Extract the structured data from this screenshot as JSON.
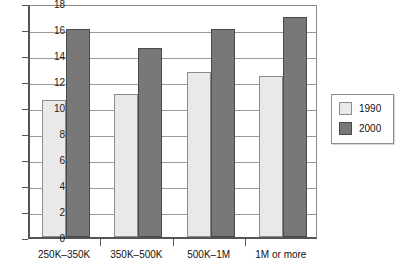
{
  "chart_data": {
    "type": "bar",
    "title": "",
    "subtitle": "",
    "xlabel": "",
    "ylabel": "",
    "categories": [
      "250K–350K",
      "350K–500K",
      "500K–1M",
      "1M or more"
    ],
    "series": [
      {
        "name": "1990",
        "color": "#e9e9e9",
        "values": [
          10.5,
          11.0,
          12.7,
          12.4
        ]
      },
      {
        "name": "2000",
        "color": "#787878",
        "values": [
          16.0,
          14.5,
          16.0,
          16.9
        ]
      }
    ],
    "ylim": [
      0,
      18
    ],
    "ytick_values": [
      0,
      2,
      4,
      6,
      8,
      10,
      12,
      14,
      16,
      18
    ],
    "ytick_labels": [
      "0",
      "2",
      "4",
      "6",
      "8",
      "10",
      "12",
      "14",
      "16",
      "18"
    ],
    "grid": true,
    "grid_axis": "y",
    "legend_position": "right",
    "legend_entries": [
      "1990",
      "2000"
    ],
    "annotations": []
  },
  "legend": {
    "entries": [
      {
        "label": "1990",
        "swatch": "legend-swatch-1990"
      },
      {
        "label": "2000",
        "swatch": "legend-swatch-2000"
      }
    ]
  },
  "caption": {
    "clipped_text": "partial text row clipped at bottom edge"
  }
}
